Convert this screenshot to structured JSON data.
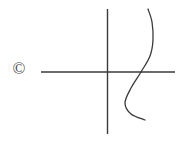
{
  "figure": {
    "background_color": "#ffffff",
    "stroke_color": "#3a3a3a",
    "width": 181,
    "height": 141,
    "watermark": {
      "symbol": "©",
      "name": "copyright-symbol",
      "x": 19,
      "y": 70
    }
  },
  "chart_data": {
    "type": "line",
    "title": "",
    "xlabel": "",
    "ylabel": "",
    "grid": false,
    "legend": null,
    "axes": {
      "x_axis": {
        "name": "x-axis",
        "x_start": 41,
        "x_end": 175,
        "y": 72
      },
      "y_axis": {
        "name": "y-axis",
        "x": 107,
        "y_start": 9,
        "y_end": 134
      },
      "origin": {
        "x": 107,
        "y": 72
      }
    },
    "series": [
      {
        "name": "cubic-curve",
        "description": "S-shaped cubic curve crossing the x-axis right of the origin",
        "points": [
          {
            "x": 148,
            "y": 9
          },
          {
            "x": 152,
            "y": 22
          },
          {
            "x": 153,
            "y": 40
          },
          {
            "x": 150,
            "y": 56
          },
          {
            "x": 141,
            "y": 72
          },
          {
            "x": 131,
            "y": 88
          },
          {
            "x": 125,
            "y": 103
          },
          {
            "x": 131,
            "y": 114
          },
          {
            "x": 145,
            "y": 120
          }
        ],
        "x_axis_crossing": {
          "x": 141,
          "y": 72
        }
      }
    ]
  }
}
